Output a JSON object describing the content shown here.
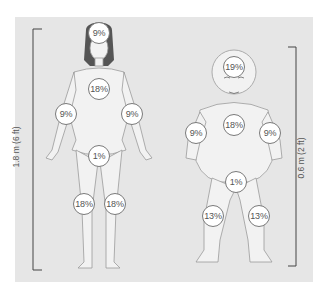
{
  "diagram": {
    "adult": {
      "height_label": "1.8 m (6 ft)",
      "regions": [
        {
          "name": "head",
          "label": "9%",
          "x": 99,
          "y": 33
        },
        {
          "name": "trunk",
          "label": "18%",
          "x": 99,
          "y": 89
        },
        {
          "name": "right-arm",
          "label": "9%",
          "x": 66,
          "y": 114
        },
        {
          "name": "left-arm",
          "label": "9%",
          "x": 132,
          "y": 114
        },
        {
          "name": "perineum",
          "label": "1%",
          "x": 99,
          "y": 156
        },
        {
          "name": "right-leg",
          "label": "18%",
          "x": 84,
          "y": 204
        },
        {
          "name": "left-leg",
          "label": "18%",
          "x": 115,
          "y": 204
        }
      ]
    },
    "infant": {
      "height_label": "0.6 m (2 ft)",
      "regions": [
        {
          "name": "head",
          "label": "19%",
          "x": 234,
          "y": 67
        },
        {
          "name": "trunk",
          "label": "18%",
          "x": 234,
          "y": 125
        },
        {
          "name": "right-arm",
          "label": "9%",
          "x": 196,
          "y": 133
        },
        {
          "name": "left-arm",
          "label": "9%",
          "x": 270,
          "y": 133
        },
        {
          "name": "perineum",
          "label": "1%",
          "x": 236,
          "y": 182
        },
        {
          "name": "right-leg",
          "label": "13%",
          "x": 213,
          "y": 216
        },
        {
          "name": "left-leg",
          "label": "13%",
          "x": 259,
          "y": 216
        }
      ]
    },
    "colors": {
      "panel": "#e6e6e6",
      "line": "#444444",
      "skin": "#f3f3f3",
      "outline": "#9a9a9a"
    }
  }
}
